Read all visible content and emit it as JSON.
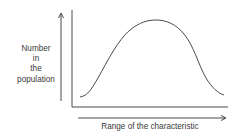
{
  "diagram": {
    "title": "",
    "y_axis_label_lines": [
      "Number",
      "in",
      "the",
      "population"
    ],
    "x_axis_label": "Range of the characteristic",
    "curve_type": "bell-shaped (normal) distribution",
    "colors": {
      "line": "#4a4a4a",
      "text": "#3a3a3a",
      "background": "#ffffff"
    }
  }
}
